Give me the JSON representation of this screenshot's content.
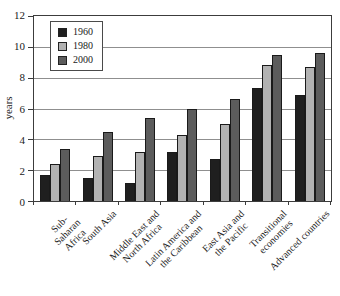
{
  "figure": {
    "background": "#ffffff",
    "frame_color": "#3c3c3c",
    "gridline_color": "#8f8f8f"
  },
  "y_axis": {
    "title": "years",
    "ticks": [
      "0",
      "2",
      "4",
      "6",
      "8",
      "10",
      "12"
    ]
  },
  "legend": {
    "entries": [
      "1960",
      "1980",
      "2000"
    ]
  },
  "chart_data": {
    "type": "bar",
    "title": "",
    "xlabel": "",
    "ylabel": "years",
    "ylim": [
      0,
      12
    ],
    "ytick_step": 2,
    "grid": true,
    "legend_position": "upper-left-inside",
    "categories": [
      "Sub-Saharan\nAfrica",
      "South Asia",
      "Middle East and\nNorth Africa",
      "Latin America and\nthe Caribbean",
      "East Asia and\nthe Pacific",
      "Transitional\neconomies",
      "Advanced countries"
    ],
    "series": [
      {
        "name": "1960",
        "color": "#1f1f1f",
        "values": [
          1.7,
          1.5,
          1.2,
          3.2,
          2.7,
          7.3,
          6.9
        ]
      },
      {
        "name": "1980",
        "color": "#b2b2b2",
        "values": [
          2.4,
          2.9,
          3.2,
          4.3,
          5.0,
          8.8,
          8.7
        ]
      },
      {
        "name": "2000",
        "color": "#5c5c5c",
        "values": [
          3.4,
          4.5,
          5.4,
          6.0,
          6.6,
          9.5,
          9.6
        ]
      }
    ]
  }
}
